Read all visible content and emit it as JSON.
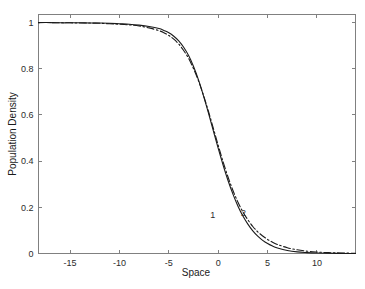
{
  "figure": {
    "background_color": "#ffffff",
    "axis_color": "#808080",
    "line_color": "#1a1a1a",
    "width": 365,
    "height": 289
  },
  "chart_data": {
    "type": "line",
    "title": "",
    "subtitle": "",
    "xlabel": "Space",
    "ylabel": "Population Density",
    "xlim": [
      -18.2,
      13.9
    ],
    "ylim": [
      0,
      1.035
    ],
    "xticks": [
      -15,
      -10,
      -5,
      0,
      5,
      10
    ],
    "xticklabels": [
      "-15",
      "-10",
      "-5",
      "0",
      "5",
      "10"
    ],
    "yticks": [
      0,
      0.2,
      0.4,
      0.6,
      0.8,
      1
    ],
    "yticklabels": [
      "0",
      "0.2",
      "0.4",
      "0.6",
      "0.8",
      "1"
    ],
    "grid": false,
    "legend": "inline-curve-labels",
    "annotations": [
      {
        "text": "1",
        "x": -0.55,
        "y": 0.155,
        "target_series": "1"
      },
      {
        "text": "2",
        "x": 2.55,
        "y": 0.162,
        "target_series": "2"
      }
    ],
    "series": [
      {
        "name": "1",
        "style": "solid",
        "description": "Logistic front, steeper transition",
        "x": [
          -18.2,
          -17,
          -16,
          -15,
          -14,
          -13,
          -12,
          -11,
          -10,
          -9,
          -8,
          -7,
          -6,
          -5.5,
          -5,
          -4.5,
          -4,
          -3.5,
          -3,
          -2.5,
          -2,
          -1.5,
          -1,
          -0.5,
          0,
          0.5,
          1,
          1.5,
          2,
          2.5,
          3,
          3.5,
          4,
          4.5,
          5,
          5.5,
          6,
          7,
          8,
          9,
          10,
          11,
          12,
          13,
          13.9
        ],
        "y": [
          1.0,
          1.0,
          0.999,
          0.999,
          0.999,
          0.998,
          0.998,
          0.997,
          0.995,
          0.993,
          0.989,
          0.983,
          0.974,
          0.966,
          0.956,
          0.941,
          0.921,
          0.893,
          0.857,
          0.81,
          0.752,
          0.684,
          0.61,
          0.532,
          0.455,
          0.382,
          0.315,
          0.256,
          0.205,
          0.162,
          0.127,
          0.098,
          0.075,
          0.057,
          0.043,
          0.032,
          0.024,
          0.013,
          0.007,
          0.004,
          0.002,
          0.001,
          0.0005,
          0.0002,
          0.0001
        ]
      },
      {
        "name": "2",
        "style": "dash-dot",
        "description": "Logistic front, slightly earlier decline and fatter right tail",
        "x": [
          -18.2,
          -17,
          -16,
          -15,
          -14,
          -13,
          -12,
          -11,
          -10,
          -9,
          -8,
          -7,
          -6,
          -5.5,
          -5,
          -4.5,
          -4,
          -3.5,
          -3,
          -2.5,
          -2,
          -1.5,
          -1,
          -0.5,
          0,
          0.5,
          1,
          1.5,
          2,
          2.5,
          3,
          3.5,
          4,
          4.5,
          5,
          5.5,
          6,
          7,
          8,
          9,
          10,
          11,
          12,
          13,
          13.9
        ],
        "y": [
          1.0,
          1.0,
          0.999,
          0.999,
          0.998,
          0.998,
          0.997,
          0.995,
          0.993,
          0.99,
          0.985,
          0.977,
          0.965,
          0.956,
          0.944,
          0.928,
          0.907,
          0.879,
          0.845,
          0.8,
          0.748,
          0.686,
          0.617,
          0.543,
          0.468,
          0.396,
          0.33,
          0.272,
          0.222,
          0.18,
          0.146,
          0.117,
          0.094,
          0.076,
          0.061,
          0.049,
          0.039,
          0.025,
          0.016,
          0.01,
          0.0065,
          0.004,
          0.0026,
          0.0016,
          0.0011
        ]
      }
    ]
  }
}
